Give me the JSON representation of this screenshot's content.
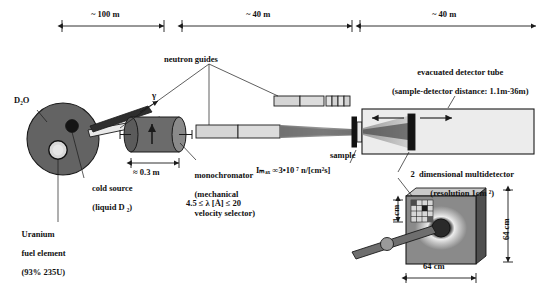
{
  "figure": {
    "colors": {
      "moderator_tank": "#636363",
      "cold_source": "#d8d8d8",
      "beam_tube": "#3a3a3a",
      "guide_light": "#d5d5d5",
      "selector_body": "#6b6b6b",
      "detector_tube": "#e8e8e8",
      "beam_cone": "#8d8d8d",
      "detector_face": "#8a8a8a",
      "outline": "#1a1a1a"
    }
  },
  "dimensions": [
    {
      "id": "dim-100m",
      "label": "~ 100 m"
    },
    {
      "id": "dim-40m-guides",
      "label": "~ 40 m"
    },
    {
      "id": "dim-40m-tube",
      "label": "~ 40 m"
    },
    {
      "id": "dim-selector",
      "label": "≈ 0.3 m"
    }
  ],
  "labels": {
    "heavy_water": "D₂O",
    "gamma": "γ",
    "cold_source_line1": "cold source",
    "cold_source_line2": "(liquid D ₂)",
    "uranium_line1": "Uranium",
    "uranium_line2": "fuel element",
    "uranium_line3": "(93% 235U)",
    "neutron_guides": "neutron guides",
    "monochromator_line1": "monochromator",
    "monochromator_line2": "(mechanical",
    "monochromator_line3": "velocity selector)",
    "wavelength_range": "4.5 ≤ λ [Å] ≤ 20",
    "sample": "sample",
    "flux": "Iₘₐₓ ∞3•10 ⁷ n/[cm²s]",
    "flux_parts": {
      "symbol": "I",
      "subscript": "max",
      "relation": "∞",
      "value": "3•10",
      "exponent": "7",
      "unit": "n/[cm²s]"
    },
    "evacuated_tube_line1": "evacuated detector tube",
    "evacuated_tube_line2": "(sample-detector distance: 1.1m-36m)",
    "multidetector_line1": "2  dimensional multidetector",
    "multidetector_line2": "(resolution 1cm ²)",
    "pixel_size": "1 cm",
    "detector_height": "64 cm",
    "detector_width": "64 cm"
  }
}
